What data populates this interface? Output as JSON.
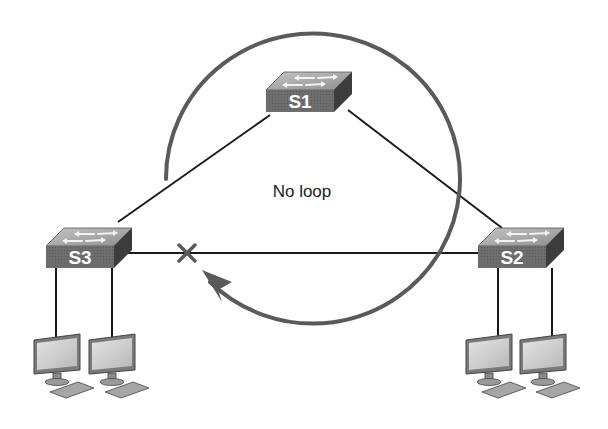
{
  "diagram": {
    "type": "network-topology",
    "caption": "No loop",
    "switches": [
      {
        "id": "S1",
        "label": "S1"
      },
      {
        "id": "S2",
        "label": "S2"
      },
      {
        "id": "S3",
        "label": "S3"
      }
    ],
    "links": [
      {
        "from": "S3",
        "to": "S1",
        "state": "forwarding"
      },
      {
        "from": "S1",
        "to": "S2",
        "state": "forwarding"
      },
      {
        "from": "S3",
        "to": "S2",
        "state": "blocked",
        "marker": "x"
      }
    ],
    "hosts": [
      {
        "attached_to": "S3",
        "count": 2
      },
      {
        "attached_to": "S2",
        "count": 2
      }
    ],
    "loop_arrow": {
      "direction": "clockwise",
      "meaning": "traffic path avoiding blocked link"
    },
    "colors": {
      "switch_front": "#6a6a6a",
      "switch_top": "#a8a8a8",
      "switch_side": "#3e3e3e",
      "link": "#1a1a1a",
      "arrow": "#5a5a5a"
    }
  }
}
